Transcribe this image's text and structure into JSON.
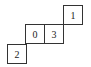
{
  "diagram": {
    "cells": [
      {
        "label": "2"
      },
      {
        "label": "0"
      },
      {
        "label": "3"
      },
      {
        "label": "1"
      }
    ]
  }
}
